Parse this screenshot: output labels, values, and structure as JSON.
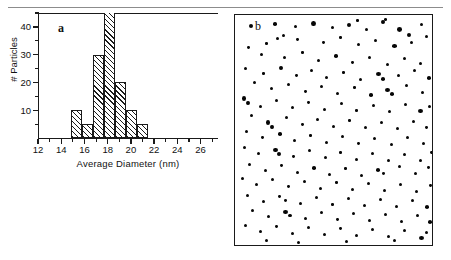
{
  "figure": {
    "panel_a_label": "a",
    "panel_b_label": "b"
  },
  "chart_data": [
    {
      "type": "bar",
      "panel": "a",
      "title": "",
      "xlabel": "Average  Diameter  (nm)",
      "ylabel": "# Particles",
      "xlim": [
        12,
        27.5
      ],
      "ylim": [
        0,
        45
      ],
      "grid": false,
      "legend": null,
      "xticks": [
        12,
        14,
        16,
        18,
        20,
        22,
        24,
        26
      ],
      "xtick_labels": [
        "12",
        "14",
        "16",
        "18",
        "20",
        "22",
        "24",
        "26"
      ],
      "xminor_ticks": [
        13,
        15,
        17,
        19,
        21,
        23,
        25,
        27
      ],
      "yticks": [
        10,
        20,
        30,
        40
      ],
      "ytick_labels": [
        "10",
        "20",
        "30",
        "40"
      ],
      "yminor_ticks": [
        5,
        15,
        25,
        35,
        45
      ],
      "bin_edges": [
        14.8,
        15.75,
        16.7,
        17.65,
        18.6,
        19.55,
        20.5,
        21.45
      ],
      "bin_centers": [
        15.3,
        16.2,
        17.2,
        18.1,
        19.1,
        20.0,
        21.0
      ],
      "categories": [
        "15.3",
        "16.2",
        "17.2",
        "18.1",
        "19.1",
        "20.0",
        "21.0"
      ],
      "values": [
        10,
        5,
        30,
        45,
        20,
        10,
        5
      ],
      "bar_clipped_at_top": [
        false,
        false,
        false,
        true,
        false,
        false,
        false
      ],
      "bar_fill": "diagonal-hatch",
      "notes": "Histogram of nanoparticle average diameters; tallest bin is clipped by the plot frame."
    },
    {
      "type": "scatter",
      "panel": "b",
      "title": "",
      "xlabel": "",
      "ylabel": "",
      "grid": false,
      "legend": null,
      "description": "TEM micrograph field of view: dark roughly-circular nanoparticles dispersed on a light background.",
      "marker_color": "#060606",
      "background_color": "#ffffff",
      "particle_count": 176,
      "particles": [
        [
          14,
          9,
          4.2,
          4.2
        ],
        [
          38,
          7,
          3.6,
          3.6
        ],
        [
          59,
          10,
          3.2,
          3.2
        ],
        [
          76,
          6,
          4.6,
          5.2
        ],
        [
          96,
          11,
          3.0,
          3.0
        ],
        [
          112,
          8,
          4.0,
          4.0
        ],
        [
          130,
          13,
          3.4,
          3.4
        ],
        [
          146,
          5,
          3.8,
          3.8
        ],
        [
          162,
          12,
          5.4,
          4.6
        ],
        [
          172,
          18,
          4.0,
          4.0
        ],
        [
          185,
          8,
          3.2,
          3.2
        ],
        [
          149,
          3,
          3.4,
          3.0
        ],
        [
          121,
          4,
          2.6,
          2.6
        ],
        [
          61,
          23,
          2.8,
          2.8
        ],
        [
          30,
          27,
          2.6,
          2.6
        ],
        [
          47,
          19,
          3.4,
          3.4
        ],
        [
          41,
          22,
          3.0,
          3.0
        ],
        [
          87,
          26,
          2.8,
          2.8
        ],
        [
          104,
          21,
          2.6,
          2.6
        ],
        [
          122,
          28,
          3.0,
          3.0
        ],
        [
          139,
          24,
          3.4,
          3.4
        ],
        [
          157,
          29,
          4.8,
          3.6
        ],
        [
          175,
          26,
          3.2,
          3.2
        ],
        [
          190,
          20,
          3.0,
          3.0
        ],
        [
          12,
          31,
          2.8,
          2.8
        ],
        [
          25,
          38,
          3.2,
          3.2
        ],
        [
          48,
          41,
          3.0,
          3.0
        ],
        [
          66,
          36,
          2.6,
          2.6
        ],
        [
          82,
          44,
          3.0,
          3.0
        ],
        [
          99,
          39,
          3.6,
          3.6
        ],
        [
          116,
          46,
          2.8,
          2.8
        ],
        [
          133,
          41,
          3.0,
          3.0
        ],
        [
          151,
          48,
          3.0,
          3.0
        ],
        [
          168,
          42,
          3.4,
          3.4
        ],
        [
          184,
          47,
          3.0,
          3.0
        ],
        [
          9,
          52,
          3.2,
          3.2
        ],
        [
          27,
          57,
          2.6,
          2.6
        ],
        [
          44,
          51,
          3.8,
          3.8
        ],
        [
          60,
          59,
          2.8,
          2.8
        ],
        [
          75,
          54,
          3.2,
          3.2
        ],
        [
          90,
          61,
          3.0,
          3.0
        ],
        [
          107,
          56,
          2.6,
          2.6
        ],
        [
          124,
          63,
          3.4,
          3.4
        ],
        [
          141,
          57,
          5.2,
          4.4
        ],
        [
          146,
          62,
          4.4,
          4.0
        ],
        [
          162,
          59,
          3.0,
          3.0
        ],
        [
          178,
          54,
          3.2,
          3.2
        ],
        [
          192,
          61,
          3.8,
          3.6
        ],
        [
          18,
          66,
          3.4,
          3.4
        ],
        [
          35,
          72,
          3.0,
          3.0
        ],
        [
          52,
          68,
          3.2,
          3.2
        ],
        [
          69,
          75,
          2.8,
          2.8
        ],
        [
          85,
          70,
          3.4,
          3.4
        ],
        [
          101,
          77,
          3.0,
          3.0
        ],
        [
          118,
          71,
          2.6,
          2.6
        ],
        [
          134,
          78,
          3.6,
          3.6
        ],
        [
          150,
          73,
          4.8,
          4.0
        ],
        [
          155,
          77,
          4.2,
          3.8
        ],
        [
          170,
          69,
          3.0,
          3.0
        ],
        [
          186,
          76,
          3.2,
          3.2
        ],
        [
          7,
          81,
          4.4,
          5.0
        ],
        [
          11,
          86,
          4.0,
          4.4
        ],
        [
          24,
          90,
          3.0,
          3.0
        ],
        [
          40,
          84,
          3.4,
          3.4
        ],
        [
          56,
          91,
          3.0,
          3.0
        ],
        [
          72,
          86,
          2.8,
          2.8
        ],
        [
          88,
          93,
          3.2,
          3.2
        ],
        [
          105,
          87,
          3.0,
          3.0
        ],
        [
          120,
          94,
          2.6,
          2.6
        ],
        [
          137,
          89,
          3.4,
          3.4
        ],
        [
          153,
          95,
          3.0,
          3.0
        ],
        [
          169,
          88,
          3.2,
          3.2
        ],
        [
          183,
          94,
          4.6,
          3.8
        ],
        [
          193,
          90,
          3.0,
          3.0
        ],
        [
          15,
          99,
          3.2,
          3.2
        ],
        [
          31,
          105,
          4.0,
          4.6
        ],
        [
          35,
          110,
          3.6,
          4.0
        ],
        [
          50,
          101,
          3.0,
          3.0
        ],
        [
          66,
          108,
          2.8,
          2.8
        ],
        [
          81,
          103,
          3.4,
          3.4
        ],
        [
          97,
          110,
          3.0,
          3.0
        ],
        [
          113,
          104,
          2.6,
          2.6
        ],
        [
          129,
          111,
          3.2,
          3.2
        ],
        [
          145,
          106,
          3.0,
          3.0
        ],
        [
          161,
          112,
          3.4,
          3.4
        ],
        [
          177,
          105,
          3.0,
          3.0
        ],
        [
          190,
          111,
          2.8,
          2.8
        ],
        [
          10,
          115,
          3.0,
          3.0
        ],
        [
          26,
          121,
          2.8,
          2.8
        ],
        [
          43,
          117,
          3.6,
          3.6
        ],
        [
          58,
          124,
          3.0,
          3.0
        ],
        [
          74,
          119,
          2.6,
          2.6
        ],
        [
          90,
          126,
          3.2,
          3.2
        ],
        [
          106,
          120,
          3.0,
          3.0
        ],
        [
          122,
          127,
          2.8,
          2.8
        ],
        [
          138,
          122,
          3.4,
          3.4
        ],
        [
          155,
          128,
          3.0,
          3.0
        ],
        [
          171,
          121,
          3.2,
          3.2
        ],
        [
          187,
          127,
          3.0,
          3.0
        ],
        [
          8,
          131,
          3.2,
          3.2
        ],
        [
          22,
          137,
          3.0,
          3.0
        ],
        [
          38,
          133,
          4.6,
          4.2
        ],
        [
          42,
          137,
          4.0,
          3.8
        ],
        [
          57,
          140,
          2.8,
          2.8
        ],
        [
          73,
          134,
          3.2,
          3.2
        ],
        [
          89,
          141,
          3.0,
          3.0
        ],
        [
          104,
          136,
          2.6,
          2.6
        ],
        [
          120,
          143,
          3.4,
          3.4
        ],
        [
          136,
          137,
          3.0,
          3.0
        ],
        [
          152,
          144,
          3.2,
          3.2
        ],
        [
          168,
          138,
          3.0,
          3.0
        ],
        [
          184,
          144,
          3.4,
          3.4
        ],
        [
          195,
          136,
          2.8,
          2.8
        ],
        [
          13,
          148,
          3.0,
          3.0
        ],
        [
          29,
          154,
          3.2,
          3.2
        ],
        [
          45,
          149,
          2.8,
          2.8
        ],
        [
          61,
          156,
          3.0,
          3.0
        ],
        [
          77,
          151,
          3.6,
          3.6
        ],
        [
          93,
          158,
          3.0,
          3.0
        ],
        [
          109,
          152,
          2.6,
          2.6
        ],
        [
          125,
          159,
          3.2,
          3.2
        ],
        [
          141,
          153,
          4.4,
          3.8
        ],
        [
          147,
          157,
          3.4,
          3.2
        ],
        [
          163,
          150,
          3.0,
          3.0
        ],
        [
          179,
          157,
          3.2,
          3.2
        ],
        [
          192,
          151,
          2.8,
          2.8
        ],
        [
          6,
          162,
          3.4,
          3.4
        ],
        [
          20,
          168,
          3.0,
          3.0
        ],
        [
          36,
          163,
          3.2,
          3.2
        ],
        [
          52,
          170,
          2.8,
          2.8
        ],
        [
          68,
          165,
          3.4,
          3.4
        ],
        [
          84,
          172,
          3.0,
          3.0
        ],
        [
          100,
          166,
          2.6,
          2.6
        ],
        [
          116,
          173,
          3.2,
          3.2
        ],
        [
          132,
          167,
          3.0,
          3.0
        ],
        [
          148,
          174,
          3.4,
          3.4
        ],
        [
          164,
          168,
          3.0,
          3.0
        ],
        [
          180,
          175,
          3.2,
          3.2
        ],
        [
          194,
          169,
          2.8,
          2.8
        ],
        [
          11,
          179,
          3.0,
          3.0
        ],
        [
          27,
          185,
          3.2,
          3.2
        ],
        [
          43,
          180,
          2.8,
          2.8
        ],
        [
          49,
          184,
          3.0,
          2.8
        ],
        [
          64,
          187,
          3.4,
          3.4
        ],
        [
          80,
          181,
          3.0,
          3.0
        ],
        [
          96,
          188,
          2.6,
          2.6
        ],
        [
          112,
          182,
          3.2,
          3.2
        ],
        [
          128,
          189,
          3.0,
          3.0
        ],
        [
          144,
          183,
          3.4,
          3.4
        ],
        [
          160,
          190,
          3.0,
          3.0
        ],
        [
          176,
          184,
          3.2,
          3.2
        ],
        [
          190,
          190,
          4.2,
          3.6
        ],
        [
          16,
          194,
          3.0,
          3.0
        ],
        [
          32,
          200,
          3.4,
          3.4
        ],
        [
          48,
          195,
          4.6,
          4.0
        ],
        [
          53,
          199,
          3.8,
          3.4
        ],
        [
          69,
          202,
          3.0,
          3.0
        ],
        [
          85,
          196,
          3.2,
          3.2
        ],
        [
          101,
          203,
          2.8,
          2.8
        ],
        [
          117,
          197,
          3.4,
          3.4
        ],
        [
          133,
          204,
          3.0,
          3.0
        ],
        [
          149,
          198,
          3.2,
          3.2
        ],
        [
          165,
          205,
          3.0,
          3.0
        ],
        [
          181,
          199,
          3.4,
          3.4
        ],
        [
          193,
          205,
          4.4,
          3.8
        ],
        [
          9,
          209,
          3.0,
          3.0
        ],
        [
          24,
          215,
          3.2,
          3.2
        ],
        [
          40,
          210,
          2.8,
          2.8
        ],
        [
          56,
          217,
          3.4,
          3.4
        ],
        [
          72,
          211,
          3.0,
          3.0
        ],
        [
          88,
          218,
          3.2,
          3.2
        ],
        [
          104,
          212,
          2.8,
          2.8
        ],
        [
          120,
          219,
          3.0,
          3.0
        ],
        [
          136,
          213,
          3.4,
          3.4
        ],
        [
          152,
          220,
          3.0,
          3.0
        ],
        [
          168,
          214,
          3.2,
          3.2
        ],
        [
          184,
          221,
          4.8,
          4.0
        ],
        [
          190,
          216,
          3.0,
          3.0
        ],
        [
          30,
          224,
          3.2,
          3.2
        ],
        [
          62,
          226,
          3.0,
          3.0
        ],
        [
          110,
          225,
          3.4,
          3.4
        ],
        [
          158,
          224,
          3.0,
          3.0
        ]
      ]
    }
  ]
}
